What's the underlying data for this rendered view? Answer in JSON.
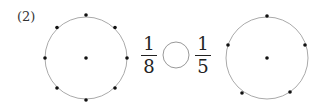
{
  "problem": {
    "label": "(2)",
    "left_fraction": {
      "numerator": "1",
      "denominator": "8"
    },
    "right_fraction": {
      "numerator": "1",
      "denominator": "5"
    },
    "comparison_blank": ""
  },
  "circles": [
    {
      "name": "left-circle",
      "divisions": 8
    },
    {
      "name": "right-circle",
      "divisions": 5
    }
  ],
  "colors": {
    "circle_stroke": "#aaaaaa",
    "dot": "#111111",
    "text": "#222222"
  }
}
